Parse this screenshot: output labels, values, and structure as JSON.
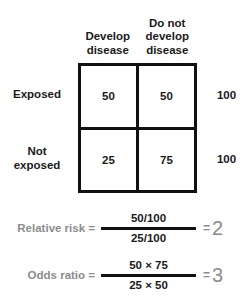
{
  "table": {
    "column_headers": [
      {
        "lines": [
          "Develop",
          "disease"
        ]
      },
      {
        "lines": [
          "Do not",
          "develop",
          "disease"
        ]
      }
    ],
    "row_labels": [
      {
        "lines": [
          "Exposed"
        ]
      },
      {
        "lines": [
          "Not",
          "exposed"
        ]
      }
    ],
    "cells": [
      [
        "50",
        "50"
      ],
      [
        "25",
        "75"
      ]
    ],
    "row_totals": [
      "100",
      "100"
    ]
  },
  "formulas": [
    {
      "label": "Relative risk =",
      "numerator": "50/100",
      "denominator": "25/100",
      "equals": "=",
      "value": "2"
    },
    {
      "label": "Odds ratio =",
      "numerator": "50 × 75",
      "denominator": "25 × 50",
      "equals": "=",
      "value": "3"
    }
  ],
  "colors": {
    "border": "#111111",
    "text": "#1a1a1a",
    "label_gray": "#8c8c8c",
    "background": "#ffffff"
  }
}
